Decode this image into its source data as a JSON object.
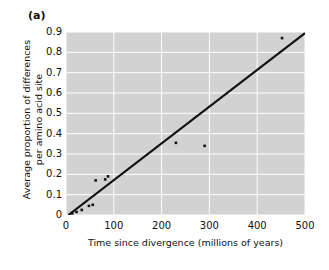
{
  "figure": {
    "panel_label": "(a)",
    "background_color": "#ffffff",
    "plot_background_color": "#d2d2d2",
    "gridline_color": "#ffffff",
    "marker_color": "#111111",
    "trendline_color": "#111111"
  },
  "chart_data": {
    "type": "scatter",
    "title": "",
    "xlabel": "Time since divergence (millions of years)",
    "ylabel_line1": "Average proportion of differences",
    "ylabel_line2": "per amino acid site",
    "xlim": [
      0,
      500
    ],
    "ylim": [
      0,
      0.9
    ],
    "xticks": [
      0,
      100,
      200,
      300,
      400,
      500
    ],
    "xtick_labels": [
      "0",
      "100",
      "200",
      "300",
      "400",
      "500"
    ],
    "yticks": [
      0,
      0.1,
      0.2,
      0.3,
      0.4,
      0.5,
      0.6,
      0.7,
      0.8,
      0.9
    ],
    "ytick_labels": [
      "0",
      "0.1",
      "0.2",
      "0.3",
      "0.4",
      "0.5",
      "0.6",
      "0.7",
      "0.8",
      "0.9"
    ],
    "grid": true,
    "legend": false,
    "legend_position": "none",
    "points": [
      {
        "x": 13,
        "y": 0.008
      },
      {
        "x": 22,
        "y": 0.015
      },
      {
        "x": 33,
        "y": 0.025
      },
      {
        "x": 48,
        "y": 0.045
      },
      {
        "x": 56,
        "y": 0.05
      },
      {
        "x": 62,
        "y": 0.17
      },
      {
        "x": 82,
        "y": 0.175
      },
      {
        "x": 88,
        "y": 0.19
      },
      {
        "x": 230,
        "y": 0.355
      },
      {
        "x": 290,
        "y": 0.34
      },
      {
        "x": 452,
        "y": 0.87
      }
    ],
    "trendline": {
      "name": "linear fit",
      "x_start": 5,
      "y_start": 0.0,
      "x_end": 500,
      "y_end": 0.895
    }
  }
}
